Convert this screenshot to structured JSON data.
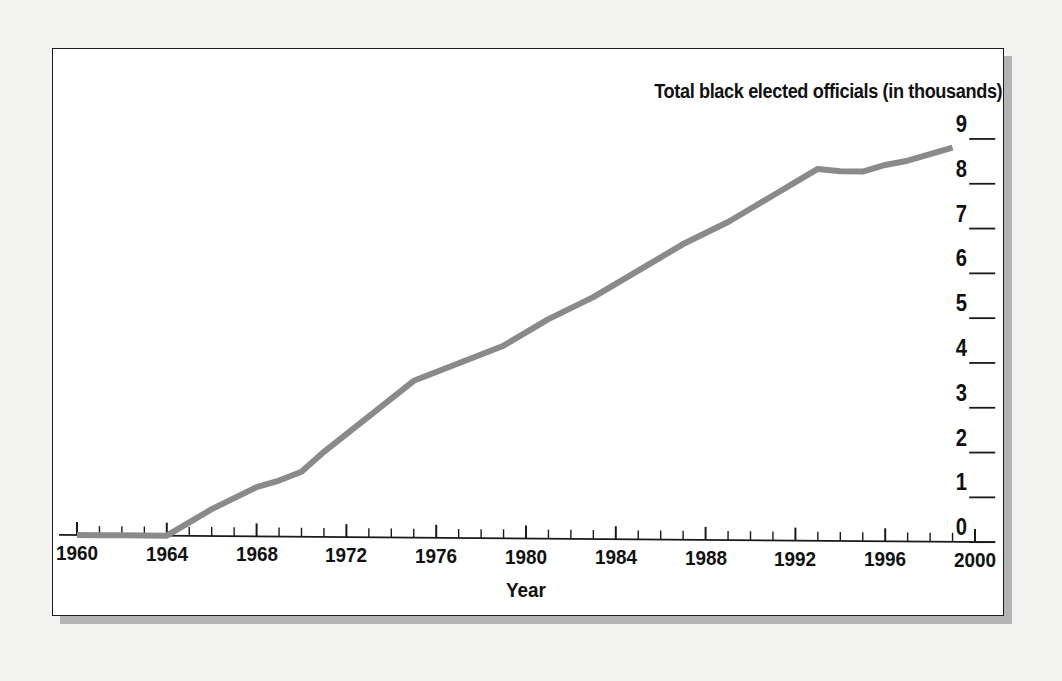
{
  "chart_data": {
    "type": "line",
    "title": "Total black elected officials (in thousands)",
    "xlabel": "Year",
    "ylabel": "",
    "xlim": [
      1959,
      2001
    ],
    "ylim": [
      0,
      9
    ],
    "grid": false,
    "legend": "none",
    "y_axis_position": "right",
    "x_tick_labels": [
      "1960",
      "1964",
      "1968",
      "1972",
      "1976",
      "1980",
      "1984",
      "1988",
      "1992",
      "1996",
      "2000"
    ],
    "x_tick_values": [
      1960,
      1964,
      1968,
      1972,
      1976,
      1980,
      1984,
      1988,
      1992,
      1996,
      2000
    ],
    "x_minor_tick_interval": 1,
    "y_tick_labels": [
      "0",
      "1",
      "2",
      "3",
      "4",
      "5",
      "6",
      "7",
      "8",
      "9"
    ],
    "y_tick_values": [
      0,
      1,
      2,
      3,
      4,
      5,
      6,
      7,
      8,
      9
    ],
    "line_color": "#8a8a8a",
    "line_width": 6,
    "axis_color": "#1a1a1a",
    "background_color": "#ffffff",
    "page_background_color": "#f3f3f1",
    "series": [
      {
        "name": "Total black elected officials (in thousands)",
        "x": [
          1960,
          1961,
          1962,
          1963,
          1964,
          1965,
          1966,
          1967,
          1968,
          1969,
          1970,
          1971,
          1972,
          1973,
          1974,
          1975,
          1976,
          1977,
          1978,
          1979,
          1980,
          1981,
          1982,
          1983,
          1984,
          1985,
          1986,
          1987,
          1988,
          1989,
          1990,
          1991,
          1992,
          1993,
          1994,
          1995,
          1996,
          1997,
          1998,
          1999
        ],
        "values": [
          0.0,
          0.0,
          0.0,
          0.0,
          0.0,
          0.3,
          0.6,
          0.85,
          1.1,
          1.25,
          1.45,
          1.9,
          2.3,
          2.7,
          3.1,
          3.5,
          3.7,
          3.9,
          4.1,
          4.3,
          4.6,
          4.9,
          5.15,
          5.4,
          5.7,
          6.0,
          6.3,
          6.6,
          6.85,
          7.1,
          7.4,
          7.7,
          8.0,
          8.3,
          8.25,
          8.25,
          8.4,
          8.5,
          8.65,
          8.8
        ]
      }
    ]
  },
  "figure": {
    "frame_present": true,
    "shadow_present": true
  }
}
